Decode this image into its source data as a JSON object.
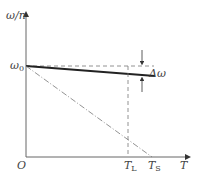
{
  "diagram": {
    "y_axis_label": "ω/n",
    "x_axis_label": "T",
    "origin_label": "O",
    "omega0_label": "ω",
    "omega0_sub": "0",
    "delta_omega_label": "Δω",
    "tl_label": "T",
    "tl_sub": "L",
    "ts_label": "T",
    "ts_sub": "S",
    "colors": {
      "axis": "#666666",
      "line": "#222222",
      "dashed": "#777777"
    }
  }
}
